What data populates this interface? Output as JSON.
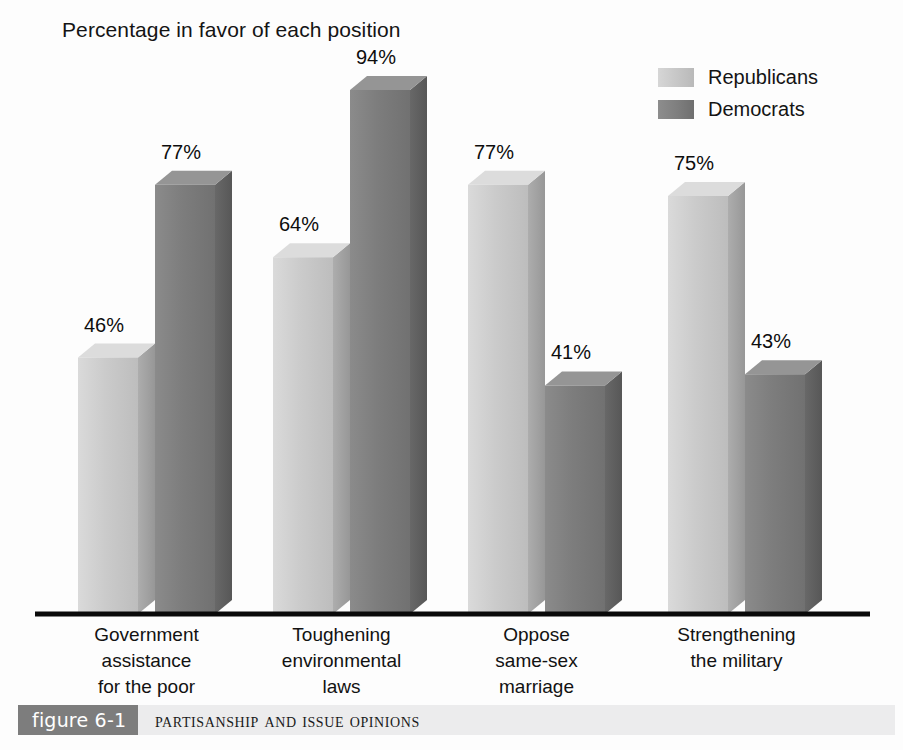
{
  "chart_data": {
    "type": "bar",
    "title": "Percentage in favor of each position",
    "xlabel": "",
    "ylabel": "",
    "ylim": [
      0,
      100
    ],
    "grid": false,
    "legend_position": "top-right",
    "style": "3d-grouped-bars",
    "categories": [
      "Government\nassistance\nfor the poor",
      "Toughening\nenvironmental\nlaws",
      "Oppose\nsame-sex\nmarriage",
      "Strengthening\nthe military"
    ],
    "series": [
      {
        "name": "Republicans",
        "color": "#c6c6c6",
        "values": [
          46,
          64,
          77,
          75
        ],
        "value_labels": [
          "46%",
          "64%",
          "77%",
          "75%"
        ]
      },
      {
        "name": "Democrats",
        "color": "#7e7e7e",
        "values": [
          77,
          94,
          41,
          43
        ],
        "value_labels": [
          "77%",
          "94%",
          "41%",
          "43%"
        ]
      }
    ]
  },
  "legend": {
    "items": [
      {
        "label": "Republicans",
        "swatch": "rep"
      },
      {
        "label": "Democrats",
        "swatch": "dem"
      }
    ]
  },
  "caption": {
    "number": "figure 6-1",
    "text": "Partisanship and Issue Opinions"
  },
  "colors": {
    "republican_front": "#c6c6c6",
    "republican_top": "#dcdcdc",
    "republican_side": "#a2a2a2",
    "democrat_front": "#7e7e7e",
    "democrat_top": "#959595",
    "democrat_side": "#606060",
    "axis": "#0a0a0a",
    "caption_band": "#ececed",
    "caption_number_bg": "#7d7d7d",
    "text": "#121212"
  }
}
